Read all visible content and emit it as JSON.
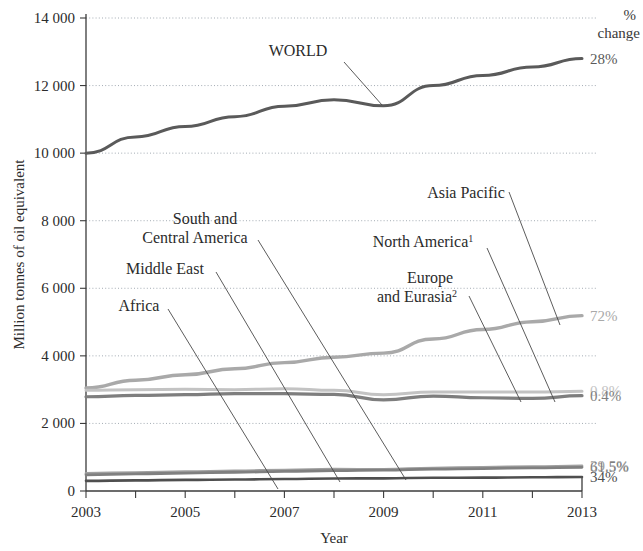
{
  "chart_data": {
    "type": "line",
    "title": "",
    "xlabel": "Year",
    "ylabel": "Million tonnes of oil equivalent",
    "x": [
      2003,
      2004,
      2005,
      2006,
      2007,
      2008,
      2009,
      2010,
      2011,
      2012,
      2013
    ],
    "xlim": [
      2003,
      2013
    ],
    "ylim": [
      0,
      14000
    ],
    "xticks": [
      2003,
      2004,
      2005,
      2006,
      2007,
      2008,
      2009,
      2010,
      2011,
      2012,
      2013
    ],
    "xtick_labels": [
      "2003",
      "",
      "2005",
      "",
      "2007",
      "",
      "2009",
      "",
      "2011",
      "",
      "2013"
    ],
    "yticks": [
      0,
      2000,
      4000,
      6000,
      8000,
      10000,
      12000,
      14000
    ],
    "ytick_labels": [
      "0",
      "2 000",
      "4 000",
      "6 000",
      "8 000",
      "10 000",
      "12 000",
      "14 000"
    ],
    "grid": "horizontal-dotted",
    "legend": "inline-annotations-with-leader-lines",
    "right_axis_header": [
      "%",
      "change"
    ],
    "series": [
      {
        "name": "WORLD",
        "pct_change": "28%",
        "color": "#5a5a5a",
        "width": 3.0,
        "values": [
          10000,
          10480,
          10790,
          11080,
          11390,
          11580,
          11400,
          12000,
          12300,
          12550,
          12800
        ]
      },
      {
        "name": "Asia Pacific",
        "pct_change": "72%",
        "color": "#a9a9a9",
        "width": 3.4,
        "values": [
          3050,
          3280,
          3440,
          3620,
          3800,
          3960,
          4080,
          4500,
          4780,
          5010,
          5190
        ]
      },
      {
        "name": "North America",
        "superscript": "1",
        "pct_change": "0.8%",
        "color": "#c3c3c3",
        "width": 3.0,
        "values": [
          2980,
          3000,
          3010,
          3000,
          3030,
          2980,
          2850,
          2930,
          2930,
          2930,
          2950
        ]
      },
      {
        "name": "Europe and Eurasia",
        "superscript": "2",
        "pct_change": "0.4%",
        "color": "#7e7e7e",
        "width": 3.2,
        "values": [
          2790,
          2830,
          2850,
          2880,
          2880,
          2860,
          2700,
          2810,
          2760,
          2740,
          2820
        ]
      },
      {
        "name": "South and Central America",
        "pct_change": "39.5%",
        "color": "#a0a0a0",
        "width": 2.8,
        "values": [
          520,
          545,
          570,
          595,
          620,
          645,
          640,
          680,
          700,
          720,
          740
        ]
      },
      {
        "name": "Middle East",
        "pct_change": "61.5%",
        "color": "#808080",
        "width": 2.8,
        "values": [
          480,
          505,
          530,
          555,
          580,
          605,
          615,
          645,
          665,
          685,
          700
        ]
      },
      {
        "name": "Africa",
        "pct_change": "34%",
        "color": "#4f4f4f",
        "width": 2.6,
        "values": [
          300,
          315,
          330,
          340,
          355,
          370,
          375,
          390,
          395,
          405,
          415
        ]
      }
    ],
    "annotations": [
      {
        "text": "WORLD",
        "x": 298,
        "y": 56,
        "anchor": "middle",
        "leader": {
          "x1": 344,
          "y1": 62,
          "x2": 382,
          "y2": 105
        }
      },
      {
        "text": "Asia Pacific",
        "x": 466,
        "y": 198,
        "anchor": "middle",
        "leader": {
          "x1": 509,
          "y1": 192,
          "x2": 560,
          "y2": 325
        }
      },
      {
        "text": "South and",
        "x": 205,
        "y": 224,
        "anchor": "middle",
        "leader": null
      },
      {
        "text": "Central America",
        "x": 195,
        "y": 243,
        "anchor": "middle",
        "leader": {
          "x1": 258,
          "y1": 240,
          "x2": 406,
          "y2": 480
        }
      },
      {
        "text": "North America",
        "superscript": "1",
        "x": 423,
        "y": 247,
        "anchor": "middle",
        "leader": {
          "x1": 487,
          "y1": 248,
          "x2": 555,
          "y2": 402
        }
      },
      {
        "text": "Middle East",
        "x": 165,
        "y": 274,
        "anchor": "middle",
        "leader": {
          "x1": 216,
          "y1": 272,
          "x2": 340,
          "y2": 482
        }
      },
      {
        "text": "Europe",
        "x": 430,
        "y": 283,
        "anchor": "middle",
        "leader": null
      },
      {
        "text": "and Eurasia",
        "superscript": "2",
        "x": 417,
        "y": 302,
        "anchor": "middle",
        "leader": {
          "x1": 469,
          "y1": 296,
          "x2": 521,
          "y2": 402
        }
      },
      {
        "text": "Africa",
        "x": 139,
        "y": 311,
        "anchor": "middle",
        "leader": {
          "x1": 168,
          "y1": 309,
          "x2": 278,
          "y2": 489
        }
      }
    ]
  },
  "axes": {
    "y_title": "Million tonnes of oil equivalent",
    "x_title": "Year",
    "pct_header_line1": "%",
    "pct_header_line2": "change"
  }
}
